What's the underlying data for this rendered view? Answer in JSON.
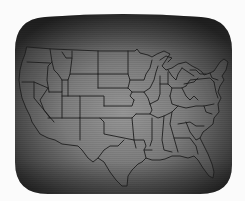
{
  "image": {
    "description": "Black-and-white photograph of a CRT display showing an outline map of the contiguous United States with state borders",
    "subject": "US state outline map on CRT screen",
    "colors": {
      "background": "#fbfbfb",
      "screen_edge": "#2e2e2e",
      "screen_center": "#8a8a8a",
      "map_lines": "#1e1e1e"
    }
  }
}
